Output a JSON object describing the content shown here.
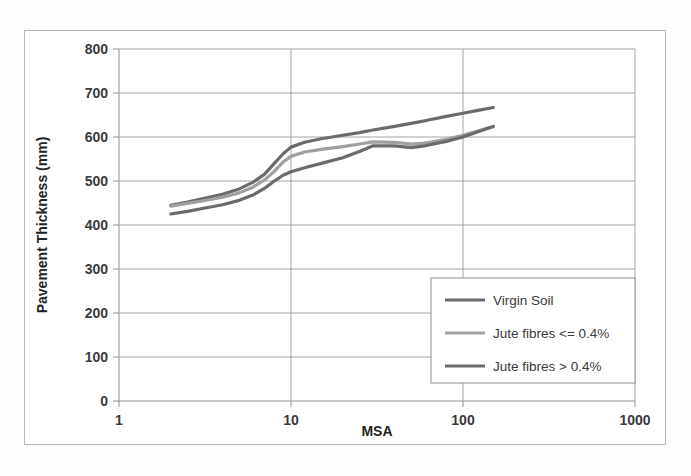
{
  "figure": {
    "background_color": "#fdfdfc",
    "frame_color": "#b9b9b9",
    "plot_background": "#ffffff",
    "gridline_color": "#9a9a9a"
  },
  "chart_data": {
    "type": "line",
    "title": "",
    "subtitle": "",
    "xlabel": "MSA",
    "ylabel": "Pavement Thickness  (mm)",
    "xscale": "log",
    "yscale": "linear",
    "xlim": [
      1,
      1000
    ],
    "ylim": [
      0,
      800
    ],
    "xticks": [
      1,
      10,
      100,
      1000
    ],
    "xtick_labels": [
      "1",
      "10",
      "100",
      "1000"
    ],
    "yticks": [
      0,
      100,
      200,
      300,
      400,
      500,
      600,
      700,
      800
    ],
    "ytick_labels": [
      "0",
      "100",
      "200",
      "300",
      "400",
      "500",
      "600",
      "700",
      "800"
    ],
    "grid": {
      "horizontal": true,
      "vertical": true
    },
    "legend": {
      "position": "lower-right",
      "entries": [
        "Virgin Soil",
        "Jute fibres <= 0.4%",
        "Jute fibres > 0.4%"
      ]
    },
    "series": [
      {
        "name": "Virgin Soil",
        "color": "#6b6b6b",
        "linewidth": 3.2,
        "x": [
          2,
          2.5,
          3,
          4,
          5,
          6,
          7,
          8,
          9,
          10,
          12,
          15,
          20,
          25,
          30,
          40,
          50,
          60,
          80,
          100,
          120,
          150
        ],
        "y": [
          445,
          452,
          459,
          470,
          482,
          497,
          515,
          540,
          562,
          577,
          588,
          596,
          604,
          610,
          616,
          624,
          631,
          637,
          647,
          654,
          660,
          667
        ]
      },
      {
        "name": "Jute fibres <= 0.4%",
        "color": "#a0a0a0",
        "linewidth": 3.2,
        "x": [
          2,
          2.5,
          3,
          4,
          5,
          6,
          7,
          8,
          9,
          10,
          12,
          15,
          20,
          25,
          30,
          40,
          50,
          60,
          80,
          100,
          120,
          150
        ],
        "y": [
          443,
          449,
          454,
          463,
          473,
          486,
          502,
          522,
          543,
          556,
          566,
          572,
          578,
          584,
          589,
          588,
          584,
          586,
          595,
          604,
          613,
          624
        ]
      },
      {
        "name": "Jute fibres > 0.4%",
        "color": "#6b6b6b",
        "linewidth": 3.2,
        "x": [
          2,
          2.5,
          3,
          4,
          5,
          6,
          7,
          8,
          9,
          10,
          12,
          15,
          20,
          25,
          30,
          40,
          50,
          60,
          80,
          100,
          120,
          150
        ],
        "y": [
          425,
          431,
          437,
          446,
          456,
          468,
          483,
          500,
          513,
          521,
          530,
          540,
          553,
          567,
          580,
          580,
          576,
          580,
          590,
          600,
          611,
          624
        ]
      }
    ]
  },
  "legend_box": {
    "border_color": "#8d8d8d",
    "background": "#ffffff"
  }
}
